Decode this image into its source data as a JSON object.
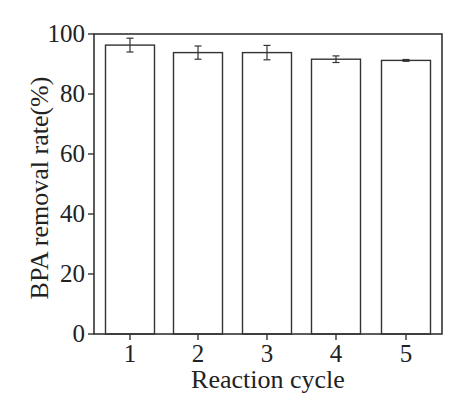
{
  "chart_data": {
    "type": "bar",
    "title": "",
    "xlabel": "Reaction cycle",
    "ylabel": "BPA removal rate(%)",
    "categories": [
      "1",
      "2",
      "3",
      "4",
      "5"
    ],
    "values": [
      96.3,
      93.8,
      93.8,
      91.6,
      91.2
    ],
    "errors": [
      2.3,
      2.2,
      2.4,
      1.1,
      0.3
    ],
    "ylim": [
      0,
      100
    ],
    "yticks": [
      0,
      20,
      40,
      60,
      80,
      100
    ],
    "grid": false,
    "legend": null,
    "bar_fill": "#ffffff",
    "bar_edge": "#333333"
  },
  "labels": {
    "xlabel": "Reaction cycle",
    "ylabel": "BPA removal rate(%)",
    "yticks": [
      "0",
      "20",
      "40",
      "60",
      "80",
      "100"
    ],
    "xticks": [
      "1",
      "2",
      "3",
      "4",
      "5"
    ]
  }
}
